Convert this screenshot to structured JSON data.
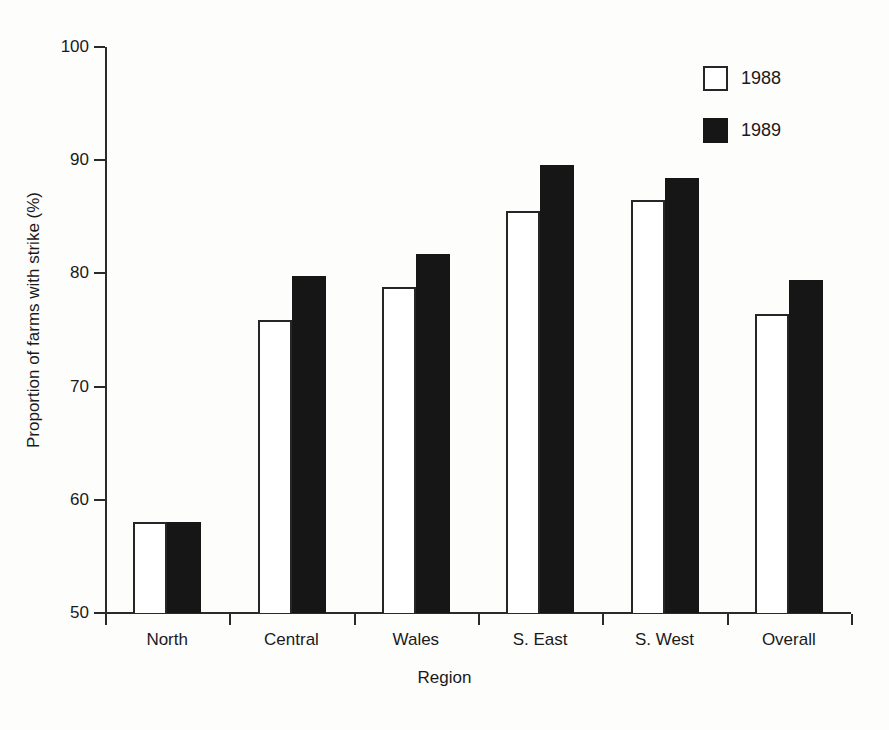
{
  "chart_data": {
    "type": "bar",
    "title": "",
    "subtitle": "",
    "xlabel": "Region",
    "ylabel": "Proportion of farms with strike (%)",
    "categories": [
      "North",
      "Central",
      "Wales",
      "S. East",
      "S. West",
      "Overall"
    ],
    "series": [
      {
        "name": "1988",
        "values": [
          58.0,
          75.9,
          78.8,
          85.5,
          86.5,
          76.4
        ],
        "color": "#ffffff",
        "edge_color": "#262626"
      },
      {
        "name": "1989",
        "values": [
          58.0,
          79.8,
          81.7,
          89.6,
          88.4,
          79.4
        ],
        "color": "#161616",
        "edge_color": "#161616"
      }
    ],
    "ylim": [
      50,
      100
    ],
    "yticks": [
      50,
      60,
      70,
      80,
      90,
      100
    ],
    "ytick_labels": [
      "50",
      "60",
      "70",
      "80",
      "90",
      "100"
    ],
    "grid": false,
    "legend_position": "top-right",
    "legend_entries": [
      "1988",
      "1989"
    ],
    "axis_color": "#2a2a2a",
    "background_color": "#fdfdfc"
  },
  "legend": {
    "entries": [
      {
        "label": "1988",
        "swatch": "open-square-swatch"
      },
      {
        "label": "1989",
        "swatch": "filled-square-swatch"
      }
    ]
  },
  "axes": {
    "x_title": "Region",
    "y_title": "Proportion of farms with strike (%)"
  }
}
